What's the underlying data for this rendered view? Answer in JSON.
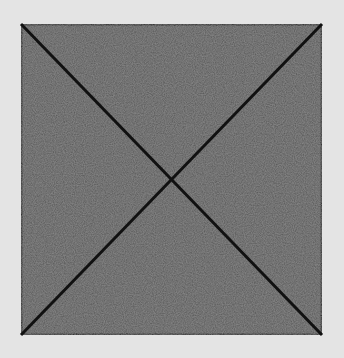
{
  "diagram": {
    "background_color": "#e4e4e4",
    "square": {
      "x": 21,
      "y": 24,
      "width": 301,
      "height": 311,
      "fill": "#555555",
      "stroke": "#1a1a1a",
      "stroke_width": 3
    },
    "diagonals": [
      {
        "x1": 21,
        "y1": 24,
        "x2": 322,
        "y2": 335
      },
      {
        "x1": 322,
        "y1": 24,
        "x2": 21,
        "y2": 335
      }
    ],
    "line_color": "#111111",
    "line_width": 3
  }
}
